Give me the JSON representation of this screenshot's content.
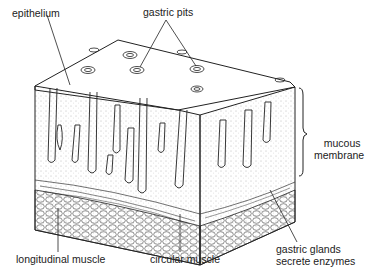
{
  "diagram": {
    "labels": {
      "epithelium": "epithelium",
      "gastric_pits": "gastric pits",
      "mucous_membrane_1": "mucous",
      "mucous_membrane_2": "membrane",
      "longitudinal_muscle": "longitudinal muscle",
      "circular_muscle": "circular muscle",
      "gastric_glands_1": "gastric glands",
      "gastric_glands_2": "secrete enzymes"
    },
    "colors": {
      "line": "#222222",
      "background": "#ffffff",
      "stipple": "#888888"
    }
  }
}
